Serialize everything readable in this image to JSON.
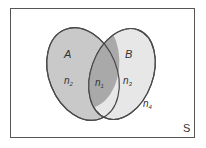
{
  "diagram": {
    "type": "venn",
    "universe_label": "S",
    "sets": [
      {
        "id": "A",
        "label": "A",
        "fill": "#c9c9c9"
      },
      {
        "id": "B",
        "label": "B",
        "fill": "#e7e7e7"
      }
    ],
    "regions": {
      "a_only": {
        "base": "n",
        "sub": "2"
      },
      "intersection": {
        "base": "n",
        "sub": "1",
        "fill": "#a9a9a9"
      },
      "b_only": {
        "base": "n",
        "sub": "3"
      },
      "outside": {
        "base": "n",
        "sub": "4"
      }
    },
    "colors": {
      "outline": "#4a4a4a",
      "border": "#555555",
      "background": "#ffffff"
    }
  }
}
